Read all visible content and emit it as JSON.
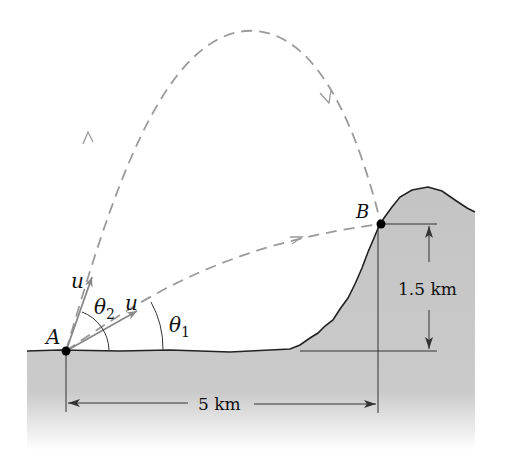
{
  "figure": {
    "points": {
      "A": "A",
      "B": "B"
    },
    "velocity_labels": {
      "upper": "u",
      "lower": "u"
    },
    "angles": {
      "theta2": {
        "symbol": "θ",
        "subscript": "2"
      },
      "theta1": {
        "symbol": "θ",
        "subscript": "1"
      }
    },
    "dimensions": {
      "height": "1.5 km",
      "horizontal": "5 km"
    }
  },
  "colors": {
    "ground": "#c4c4c4",
    "trajectory": "#9a9a9a",
    "line": "#222222",
    "point": "#000000"
  }
}
